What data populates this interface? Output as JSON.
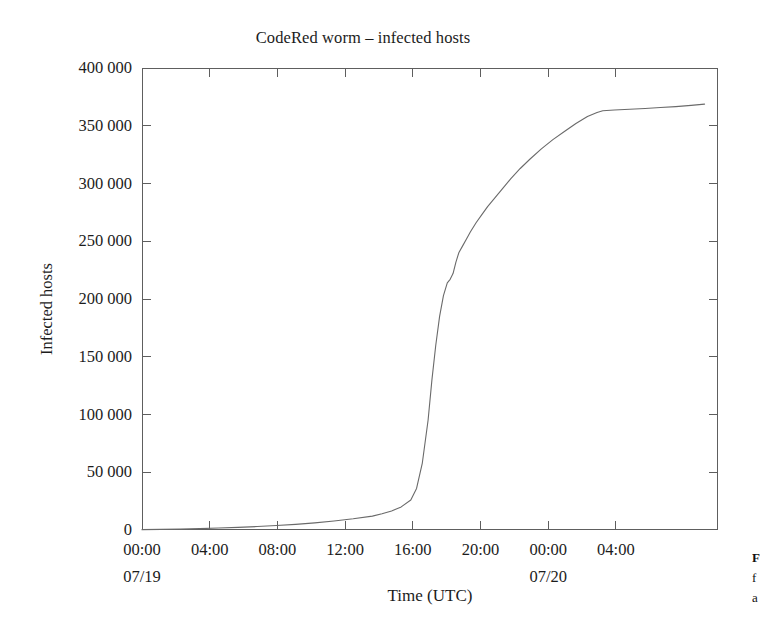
{
  "figure": {
    "background_color": "#ffffff",
    "frame_color": "#5e5e5e",
    "line_color": "#6a6a6a",
    "text_color": "#1c1c1c"
  },
  "chart_data": {
    "type": "line",
    "title": "CodeRed worm – infected hosts",
    "xlabel": "Time (UTC)",
    "ylabel": "Infected hosts",
    "grid": false,
    "legend": "none",
    "xlim": [
      0,
      30
    ],
    "ylim": [
      0,
      400000
    ],
    "x_unit": "hours since 07/19 00:00 UTC",
    "xtick_labels": [
      "00:00",
      "04:00",
      "08:00",
      "12:00",
      "16:00",
      "20:00",
      "00:00",
      "04:00"
    ],
    "xtick_sublabels": [
      "07/19",
      "",
      "",
      "",
      "",
      "",
      "07/20",
      ""
    ],
    "xtick_values": [
      0,
      4,
      8,
      12,
      16,
      20,
      24,
      28
    ],
    "ytick_labels": [
      "0",
      "50 000",
      "100 000",
      "150 000",
      "200 000",
      "250 000",
      "300 000",
      "350 000",
      "400 000"
    ],
    "ytick_values": [
      0,
      50000,
      100000,
      150000,
      200000,
      250000,
      300000,
      350000,
      400000
    ],
    "series": [
      {
        "name": "Infected hosts",
        "color": "#6a6a6a",
        "x": [
          0,
          1,
          2,
          3,
          4,
          5,
          6,
          7,
          8,
          9,
          10,
          11,
          12,
          12.5,
          13,
          13.5,
          14,
          14.3,
          14.6,
          14.9,
          15.1,
          15.3,
          15.5,
          15.7,
          15.9,
          16.05,
          16.2,
          16.35,
          16.5,
          16.7,
          16.9,
          17.1,
          17.4,
          17.7,
          18.0,
          18.4,
          18.8,
          19.2,
          19.7,
          20.2,
          20.8,
          21.4,
          22.0,
          22.6,
          23.2,
          23.7,
          24.0,
          24.6,
          25.4,
          26.2,
          27.0,
          27.8,
          28.6,
          29.3
        ],
        "y": [
          300,
          500,
          800,
          1200,
          1700,
          2300,
          3000,
          3900,
          4900,
          6200,
          7800,
          9700,
          12000,
          14000,
          16500,
          20000,
          26000,
          36000,
          58000,
          95000,
          130000,
          160000,
          185000,
          203000,
          214000,
          217000,
          222000,
          232000,
          240000,
          246000,
          252000,
          258000,
          266000,
          273000,
          280000,
          288000,
          296000,
          304000,
          313000,
          321000,
          330000,
          338000,
          345000,
          352000,
          358000,
          361500,
          363000,
          363600,
          364300,
          365000,
          365800,
          366600,
          367600,
          368700
        ]
      }
    ],
    "peak_value": 368700,
    "plateau_value": 363000,
    "plateau_time": "00:00 07/20"
  },
  "caption_fragment": {
    "line1": "F",
    "line2": "f",
    "line3": "a"
  }
}
